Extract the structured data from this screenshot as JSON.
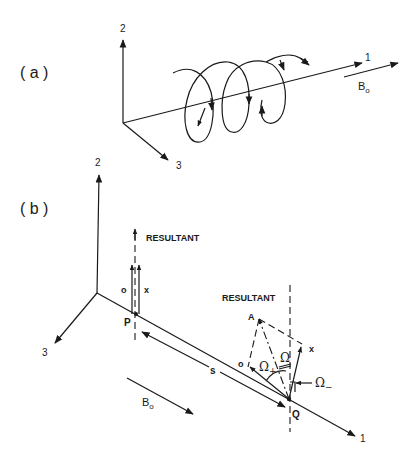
{
  "figure": {
    "panel_a": {
      "label": "( a )",
      "axes": {
        "axis1": "1",
        "axis2": "2",
        "axis3": "3"
      },
      "field_label": "B",
      "field_subscript": "o"
    },
    "panel_b": {
      "label": "( b )",
      "axes": {
        "axis1": "1",
        "axis2": "2",
        "axis3": "3"
      },
      "point_p": "P",
      "point_q": "Q",
      "point_a": "A",
      "resultant_p": "RESULTANT",
      "resultant_q": "RESULTANT",
      "vec_o_p": "o",
      "vec_x_p": "x",
      "vec_o_q": "o",
      "vec_x_q": "x",
      "distance_label": "s",
      "field_label": "B",
      "field_subscript": "o",
      "omega": "Ω",
      "omega_plus": "Ω",
      "omega_plus_sub": "+",
      "omega_minus": "Ω",
      "omega_minus_sub": "−"
    }
  }
}
